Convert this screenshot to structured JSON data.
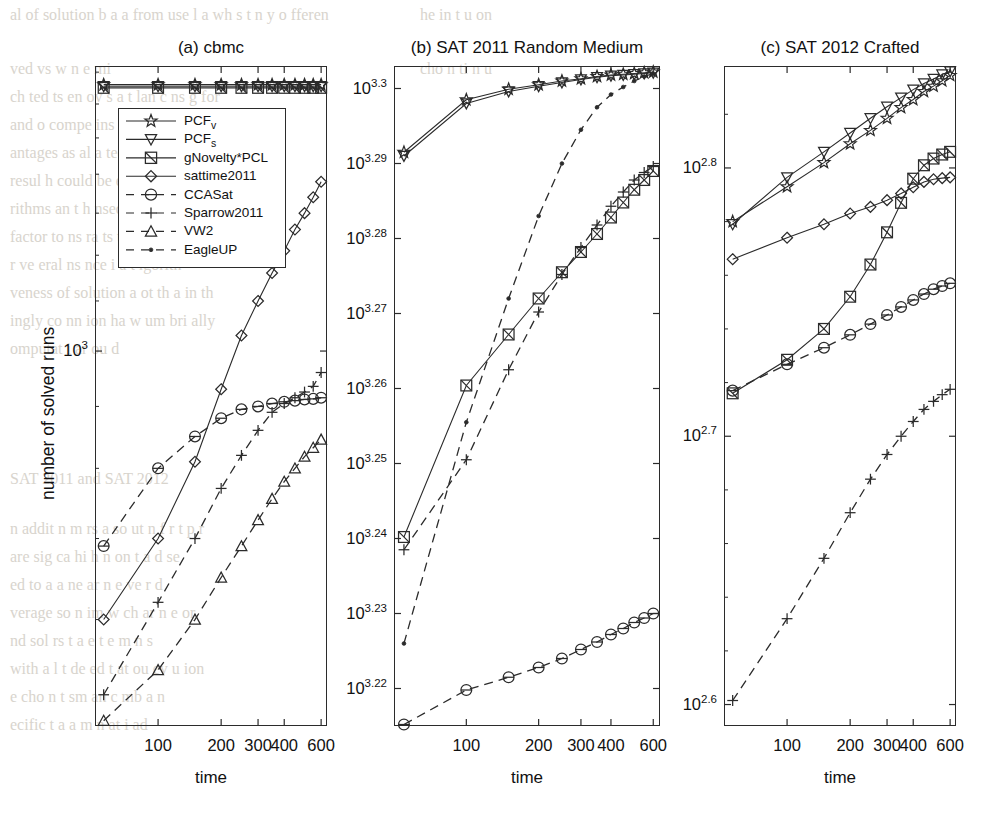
{
  "figure": {
    "ylabel": "number of solved runs",
    "xlabel": "time"
  },
  "legend": {
    "entries": [
      {
        "label": "PCF",
        "sub": "v",
        "marker": "star",
        "line": "solid"
      },
      {
        "label": "PCF",
        "sub": "s",
        "marker": "triangle-down",
        "line": "solid"
      },
      {
        "label": "gNovelty*PCL",
        "sub": "",
        "marker": "square",
        "line": "solid"
      },
      {
        "label": "sattime2011",
        "sub": "",
        "marker": "diamond",
        "line": "solid"
      },
      {
        "label": "CCASat",
        "sub": "",
        "marker": "circle",
        "line": "dashed"
      },
      {
        "label": "Sparrow2011",
        "sub": "",
        "marker": "plus",
        "line": "dashed"
      },
      {
        "label": "VW2",
        "sub": "",
        "marker": "triangle-up",
        "line": "dashed"
      },
      {
        "label": "EagleUP",
        "sub": "",
        "marker": "dot",
        "line": "dashed"
      }
    ]
  },
  "chart_data": [
    {
      "type": "line",
      "panel": "a",
      "title": "(a) cbmc",
      "xlabel": "time",
      "ylabel": "number of solved runs",
      "xscale": "log",
      "yscale": "log",
      "xlim": [
        50,
        640
      ],
      "ylim": [
        490,
        1720
      ],
      "xticks": [
        100,
        200,
        300,
        400,
        600
      ],
      "xtick_labels": [
        "100",
        "200",
        "300",
        "400",
        "600"
      ],
      "yticks": [
        1000
      ],
      "ytick_labels": [
        "10^3"
      ],
      "x": [
        55,
        100,
        150,
        200,
        250,
        300,
        350,
        400,
        450,
        500,
        550,
        600
      ],
      "series": [
        {
          "name": "PCF_v",
          "marker": "star",
          "line": "solid",
          "values": [
            1660,
            1660,
            1660,
            1660,
            1660,
            1660,
            1660,
            1660,
            1660,
            1660,
            1660,
            1660
          ]
        },
        {
          "name": "PCF_s",
          "marker": "triangle-down",
          "line": "solid",
          "values": [
            1655,
            1655,
            1655,
            1655,
            1655,
            1655,
            1655,
            1655,
            1655,
            1655,
            1655,
            1655
          ]
        },
        {
          "name": "gNovelty*PCL",
          "marker": "square",
          "line": "solid",
          "values": [
            1650,
            1650,
            1650,
            1650,
            1650,
            1650,
            1650,
            1650,
            1650,
            1650,
            1650,
            1650
          ]
        },
        {
          "name": "sattime2011",
          "marker": "diamond",
          "line": "solid",
          "values": [
            600,
            700,
            810,
            930,
            1030,
            1100,
            1160,
            1210,
            1260,
            1300,
            1340,
            1380
          ]
        },
        {
          "name": "CCASat",
          "marker": "circle",
          "line": "dashed",
          "values": [
            690,
            800,
            850,
            880,
            895,
            900,
            905,
            908,
            910,
            912,
            913,
            915
          ]
        },
        {
          "name": "Sparrow2011",
          "marker": "plus",
          "line": "dashed",
          "values": [
            520,
            620,
            700,
            770,
            820,
            860,
            890,
            905,
            915,
            925,
            935,
            960
          ]
        },
        {
          "name": "VW2",
          "marker": "triangle-up",
          "line": "dashed",
          "values": [
            495,
            545,
            600,
            650,
            690,
            725,
            755,
            780,
            800,
            818,
            832,
            845
          ]
        }
      ]
    },
    {
      "type": "line",
      "panel": "b",
      "title": "(b) SAT 2011 Random Medium",
      "xlabel": "time",
      "xscale": "log",
      "yscale": "log",
      "xlim": [
        50,
        640
      ],
      "xticks": [
        100,
        200,
        300,
        400,
        600
      ],
      "xtick_labels": [
        "100",
        "200",
        "300",
        "400",
        "600"
      ],
      "ylim_exp": [
        3.215,
        3.303
      ],
      "yticks_exp": [
        3.22,
        3.23,
        3.24,
        3.25,
        3.26,
        3.27,
        3.28,
        3.29,
        3.3
      ],
      "ytick_labels": [
        "10^3.22",
        "10^3.23",
        "10^3.24",
        "10^3.25",
        "10^3.26",
        "10^3.27",
        "10^3.28",
        "10^3.29",
        "10^3.3"
      ],
      "x": [
        55,
        100,
        150,
        200,
        250,
        300,
        350,
        400,
        450,
        500,
        550,
        600
      ],
      "series": [
        {
          "name": "PCF_v",
          "marker": "star",
          "line": "solid",
          "values_exp": [
            3.2915,
            3.2985,
            3.2999,
            3.3005,
            3.301,
            3.3013,
            3.3016,
            3.3018,
            3.3019,
            3.302,
            3.3021,
            3.3022
          ]
        },
        {
          "name": "PCF_s",
          "marker": "triangle-down",
          "line": "solid",
          "values_exp": [
            3.291,
            3.298,
            3.2996,
            3.3003,
            3.3008,
            3.3012,
            3.3015,
            3.3017,
            3.3018,
            3.3019,
            3.302,
            3.3021
          ]
        },
        {
          "name": "gNovelty*PCL",
          "marker": "square",
          "line": "solid",
          "values_exp": [
            3.2402,
            3.2604,
            3.2672,
            3.272,
            3.2755,
            3.2782,
            3.2806,
            3.2828,
            3.2848,
            3.2865,
            3.2878,
            3.289
          ]
        },
        {
          "name": "Sparrow2011",
          "marker": "plus",
          "line": "dashed",
          "values_exp": [
            3.2385,
            3.2505,
            3.2625,
            3.2702,
            3.2752,
            3.2788,
            3.2818,
            3.2843,
            3.2862,
            3.2878,
            3.2888,
            3.2896
          ]
        },
        {
          "name": "CCASat",
          "marker": "circle",
          "line": "dashed",
          "values_exp": [
            3.2152,
            3.2198,
            3.2215,
            3.2228,
            3.224,
            3.2252,
            3.2262,
            3.2272,
            3.228,
            3.2288,
            3.2294,
            3.23
          ]
        },
        {
          "name": "EagleUP",
          "marker": "dot",
          "line": "dashed",
          "values_exp": [
            3.226,
            3.2555,
            3.272,
            3.283,
            3.29,
            3.2945,
            3.2975,
            3.2992,
            3.3002,
            3.301,
            3.3016,
            3.302
          ]
        }
      ]
    },
    {
      "type": "line",
      "panel": "c",
      "title": "(c) SAT 2012 Crafted",
      "xlabel": "time",
      "xscale": "log",
      "yscale": "log",
      "xlim": [
        50,
        640
      ],
      "xticks": [
        100,
        200,
        300,
        400,
        600
      ],
      "xtick_labels": [
        "100",
        "200",
        "300",
        "400",
        "600"
      ],
      "ylim_exp": [
        2.592,
        2.838
      ],
      "yticks_exp": [
        2.6,
        2.7,
        2.8
      ],
      "ytick_labels": [
        "10^2.6",
        "10^2.7",
        "10^2.8"
      ],
      "x": [
        55,
        100,
        150,
        200,
        250,
        300,
        350,
        400,
        450,
        500,
        550,
        600
      ],
      "series": [
        {
          "name": "PCF_v",
          "marker": "star",
          "line": "solid",
          "values_exp": [
            2.78,
            2.793,
            2.802,
            2.809,
            2.814,
            2.8185,
            2.8225,
            2.8255,
            2.8285,
            2.8305,
            2.8325,
            2.8345
          ]
        },
        {
          "name": "PCF_s",
          "marker": "triangle-down",
          "line": "solid",
          "values_exp": [
            2.779,
            2.7965,
            2.806,
            2.813,
            2.8185,
            2.8228,
            2.8262,
            2.8292,
            2.8315,
            2.8332,
            2.8348,
            2.836
          ]
        },
        {
          "name": "sattime2011",
          "marker": "diamond",
          "line": "solid",
          "values_exp": [
            2.766,
            2.774,
            2.779,
            2.783,
            2.7855,
            2.788,
            2.7905,
            2.7928,
            2.7948,
            2.7958,
            2.7962,
            2.7965
          ]
        },
        {
          "name": "gNovelty*PCL",
          "marker": "square",
          "line": "solid",
          "values_exp": [
            2.716,
            2.7285,
            2.74,
            2.752,
            2.764,
            2.776,
            2.787,
            2.796,
            2.801,
            2.8035,
            2.805,
            2.806
          ]
        },
        {
          "name": "CCASat",
          "marker": "circle",
          "line": "dashed",
          "values_exp": [
            2.717,
            2.7268,
            2.733,
            2.7378,
            2.7418,
            2.7452,
            2.7482,
            2.7508,
            2.753,
            2.7548,
            2.756,
            2.757
          ]
        },
        {
          "name": "Sparrow2011",
          "marker": "plus",
          "line": "dashed",
          "values_exp": [
            2.6015,
            2.632,
            2.6545,
            2.6715,
            2.684,
            2.6932,
            2.7,
            2.7055,
            2.71,
            2.713,
            2.7155,
            2.7175
          ]
        }
      ]
    }
  ]
}
